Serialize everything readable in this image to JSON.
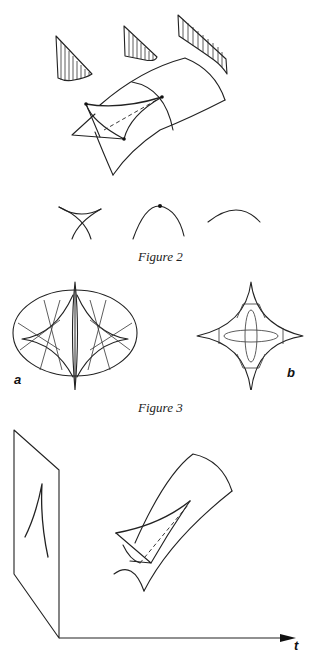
{
  "page": {
    "figures": [
      {
        "id": "figure-1-top",
        "caption": "",
        "description": "surface with cusp-shaped swallowtail fold and three hatched cross-section profiles"
      },
      {
        "id": "figure-2",
        "caption": "Figure 2",
        "panels": [
          "crossing curves (swallowtail section)",
          "arc with marked point",
          "smooth arc"
        ]
      },
      {
        "id": "figure-3",
        "caption": "Figure 3",
        "panels": [
          {
            "label": "a"
          },
          {
            "label": "b"
          }
        ]
      },
      {
        "id": "figure-4-bottom",
        "caption": "",
        "axis_label": "t"
      }
    ]
  },
  "captions": {
    "fig2": "Figure 2",
    "fig3": "Figure 3"
  },
  "labels": {
    "fig3a": "a",
    "fig3b": "b",
    "t_axis": "t"
  }
}
